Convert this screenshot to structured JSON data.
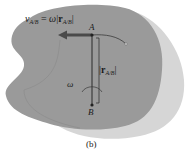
{
  "diagram": {
    "caption": "(b)",
    "velocity_label": {
      "lhs_symbol": "v",
      "lhs_sub": "A/B",
      "equals": "=",
      "omega": "ω",
      "bar_left": "|",
      "r_symbol": "r",
      "r_sub": "A/B",
      "bar_right": "|"
    },
    "point_a": "A",
    "point_b": "B",
    "omega_label": "ω",
    "distance_label": {
      "bar_left": "|",
      "r_symbol": "r",
      "r_sub": "A/B",
      "bar_right": "|"
    },
    "colors": {
      "body_fill": "#9a9a9a",
      "shadow_fill": "#d4d4d4",
      "arrow_color": "#4a4a4a",
      "line_color": "#2a2a2a"
    }
  }
}
